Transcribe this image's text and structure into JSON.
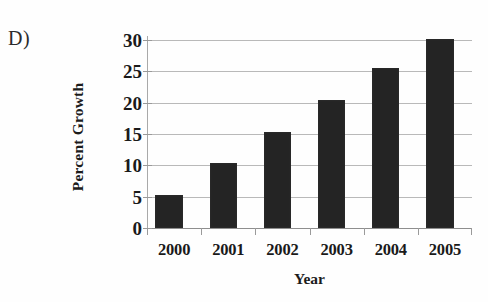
{
  "panel": {
    "label": "D)"
  },
  "chart_data": {
    "type": "bar",
    "title": "",
    "subtitle": "",
    "xlabel": "Year",
    "ylabel": "Percent Growth",
    "categories": [
      "2000",
      "2001",
      "2002",
      "2003",
      "2004",
      "2005"
    ],
    "values": [
      5.3,
      10.3,
      15.4,
      20.4,
      25.5,
      30.2
    ],
    "series": [
      {
        "name": "Percent Growth",
        "values": [
          5.3,
          10.3,
          15.4,
          20.4,
          25.5,
          30.2
        ]
      }
    ],
    "ylim": [
      0,
      30
    ],
    "xlim_categories": 6,
    "ytick_labels": [
      "0",
      "5",
      "10",
      "15",
      "20",
      "25",
      "30"
    ],
    "ytick_values": [
      0,
      5,
      10,
      15,
      20,
      25,
      30
    ],
    "grid": "horizontal",
    "legend": "none",
    "annotations": [
      "D)"
    ],
    "colors": {
      "bar_fill": "#242424",
      "gridline": "#b9b9b9",
      "axis_line": "#9a9a9a",
      "background": "#fefefe",
      "text": "#1a1a1a"
    }
  }
}
